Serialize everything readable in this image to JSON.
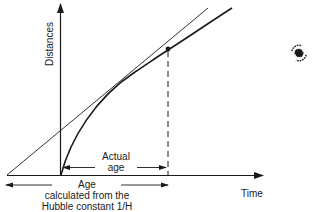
{
  "diagram": {
    "type": "hubble-age-diagram",
    "axes": {
      "y_label": "Distances",
      "x_label": "Time"
    },
    "labels": {
      "actual_age_line1": "Actual",
      "actual_age_line2": "age",
      "hubble_age_line1": "Age",
      "hubble_age_line2": "calculated from the",
      "hubble_age_line3": "Hubble constant 1/H"
    },
    "elements": {
      "tangent_line": "straight line (constant expansion)",
      "expansion_curve": "decelerating expansion curve",
      "present_point": "present epoch marker",
      "dashed_present_line": "dashed vertical at present",
      "galaxy_icon": "spiral-galaxy-icon"
    },
    "colors": {
      "ink": "#1a1a1a",
      "background": "#ffffff"
    }
  }
}
